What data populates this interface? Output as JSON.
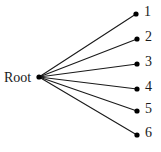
{
  "chart_data": {
    "type": "diagram",
    "title": "",
    "diagram_kind": "star-tree",
    "background_color": "#ffffff",
    "edge_color": "#1a1a1a",
    "node_color": "#000000",
    "text_color": "#1a1a1a",
    "root": {
      "id": "root",
      "label": "Root",
      "x": 39,
      "y": 77,
      "label_x": 4,
      "label_y": 71,
      "dot_radius": 2.6
    },
    "leaves": [
      {
        "id": "leaf-1",
        "label": "1",
        "x": 136,
        "y": 14,
        "label_x": 144,
        "label_y": 5,
        "dot_radius": 2.6
      },
      {
        "id": "leaf-2",
        "label": "2",
        "x": 137,
        "y": 39,
        "label_x": 145,
        "label_y": 30,
        "dot_radius": 2.6
      },
      {
        "id": "leaf-3",
        "label": "3",
        "x": 137,
        "y": 64,
        "label_x": 145,
        "label_y": 55,
        "dot_radius": 2.6
      },
      {
        "id": "leaf-4",
        "label": "4",
        "x": 137,
        "y": 89,
        "label_x": 145,
        "label_y": 80,
        "dot_radius": 2.6
      },
      {
        "id": "leaf-5",
        "label": "5",
        "x": 137,
        "y": 111,
        "label_x": 145,
        "label_y": 102,
        "dot_radius": 2.6
      },
      {
        "id": "leaf-6",
        "label": "6",
        "x": 137,
        "y": 135,
        "label_x": 145,
        "label_y": 126,
        "dot_radius": 2.6
      }
    ],
    "edges": [
      {
        "from": "root",
        "to": "leaf-1"
      },
      {
        "from": "root",
        "to": "leaf-2"
      },
      {
        "from": "root",
        "to": "leaf-3"
      },
      {
        "from": "root",
        "to": "leaf-4"
      },
      {
        "from": "root",
        "to": "leaf-5"
      },
      {
        "from": "root",
        "to": "leaf-6"
      }
    ],
    "edge_width": 1.1,
    "node_count": 7,
    "leaf_count": 6
  }
}
